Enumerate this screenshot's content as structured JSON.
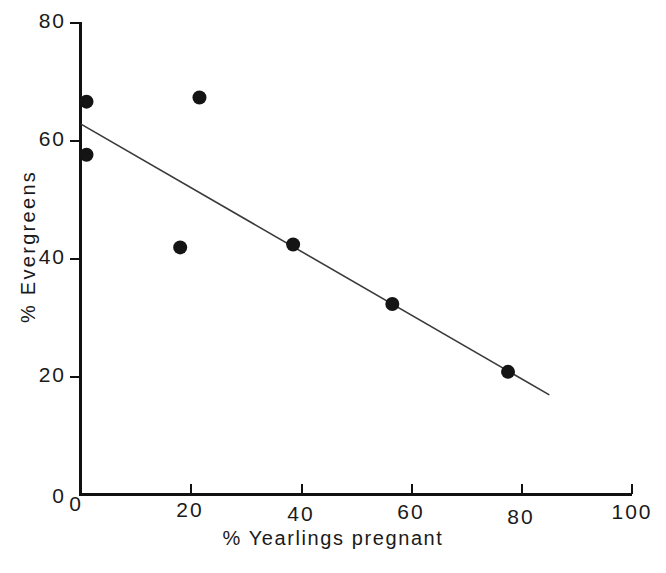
{
  "chart_data": {
    "type": "scatter",
    "title": "",
    "xlabel": "% Yearlings pregnant",
    "ylabel": "% Evergreens",
    "xlim": [
      0,
      100
    ],
    "ylim": [
      0,
      80
    ],
    "xticks": [
      0,
      20,
      40,
      60,
      80,
      100
    ],
    "yticks": [
      0,
      20,
      40,
      60,
      80
    ],
    "xtick_labels": [
      "0",
      "20",
      "40",
      "60",
      "80",
      "100"
    ],
    "ytick_labels": [
      "0",
      "20",
      "40",
      "60",
      "80"
    ],
    "grid": false,
    "legend": null,
    "points": [
      {
        "x": 1.0,
        "y": 66.5
      },
      {
        "x": 1.0,
        "y": 57.5
      },
      {
        "x": 18.0,
        "y": 41.8
      },
      {
        "x": 21.5,
        "y": 67.2
      },
      {
        "x": 38.5,
        "y": 42.3
      },
      {
        "x": 56.5,
        "y": 32.2
      },
      {
        "x": 77.5,
        "y": 20.7
      }
    ],
    "series": [
      {
        "name": "observations",
        "type": "scatter",
        "x": [
          1.0,
          1.0,
          18.0,
          21.5,
          38.5,
          56.5,
          77.5
        ],
        "values": [
          66.5,
          57.5,
          41.8,
          67.2,
          42.3,
          32.2,
          20.7
        ]
      },
      {
        "name": "regression-line",
        "type": "line",
        "x": [
          0.0,
          85.0
        ],
        "values": [
          62.7,
          16.8
        ]
      }
    ],
    "trend_line": {
      "x_start": 0.0,
      "y_start": 62.7,
      "x_end": 85.0,
      "y_end": 16.8,
      "slope": -0.54,
      "intercept": 62.7
    },
    "marker_radius_px": 7,
    "colors": {
      "marker": "#141414",
      "line": "#3a3a3a",
      "axis": "#111111",
      "background": "#ffffff"
    }
  },
  "axes": {
    "y_title": "% Evergreens",
    "x_title": "% Yearlings pregnant"
  }
}
